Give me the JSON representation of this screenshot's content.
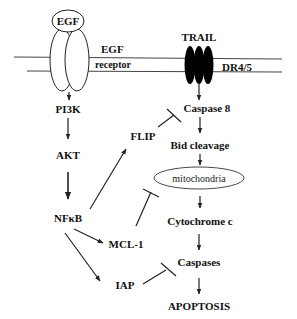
{
  "diagram": {
    "type": "signaling-pathway",
    "colors": {
      "line": "#222222",
      "text": "#111111",
      "receptor_fill": "#000000",
      "background": "#ffffff"
    },
    "membrane": {
      "label_left": "EGF",
      "label_left2": "receptor",
      "label_right": "DR4/5"
    },
    "nodes": {
      "egf": "EGF",
      "trail": "TRAIL",
      "pi3k": "PI3K",
      "akt": "AKT",
      "nfkb": "NFκB",
      "flip": "FLIP",
      "mcl1": "MCL-1",
      "iap": "IAP",
      "caspase8": "Caspase 8",
      "bid": "Bid cleavage",
      "mito": "mitochondria",
      "cytc": "Cytochrome c",
      "caspases": "Caspases",
      "apoptosis": "APOPTOSIS"
    },
    "edges": [
      {
        "from": "EGF receptor",
        "to": "PI3K",
        "type": "activation"
      },
      {
        "from": "PI3K",
        "to": "AKT",
        "type": "activation"
      },
      {
        "from": "AKT",
        "to": "NFκB",
        "type": "activation"
      },
      {
        "from": "NFκB",
        "to": "FLIP",
        "type": "activation"
      },
      {
        "from": "NFκB",
        "to": "MCL-1",
        "type": "activation"
      },
      {
        "from": "NFκB",
        "to": "IAP",
        "type": "activation"
      },
      {
        "from": "FLIP",
        "to": "Caspase 8",
        "type": "inhibition"
      },
      {
        "from": "MCL-1",
        "to": "mitochondria",
        "type": "inhibition"
      },
      {
        "from": "IAP",
        "to": "Caspases",
        "type": "inhibition"
      },
      {
        "from": "DR4/5",
        "to": "Caspase 8",
        "type": "activation"
      },
      {
        "from": "Caspase 8",
        "to": "Bid cleavage",
        "type": "activation"
      },
      {
        "from": "Bid cleavage",
        "to": "mitochondria",
        "type": "activation"
      },
      {
        "from": "mitochondria",
        "to": "Cytochrome c",
        "type": "activation"
      },
      {
        "from": "Cytochrome c",
        "to": "Caspases",
        "type": "activation"
      },
      {
        "from": "Caspases",
        "to": "APOPTOSIS",
        "type": "activation"
      }
    ]
  }
}
